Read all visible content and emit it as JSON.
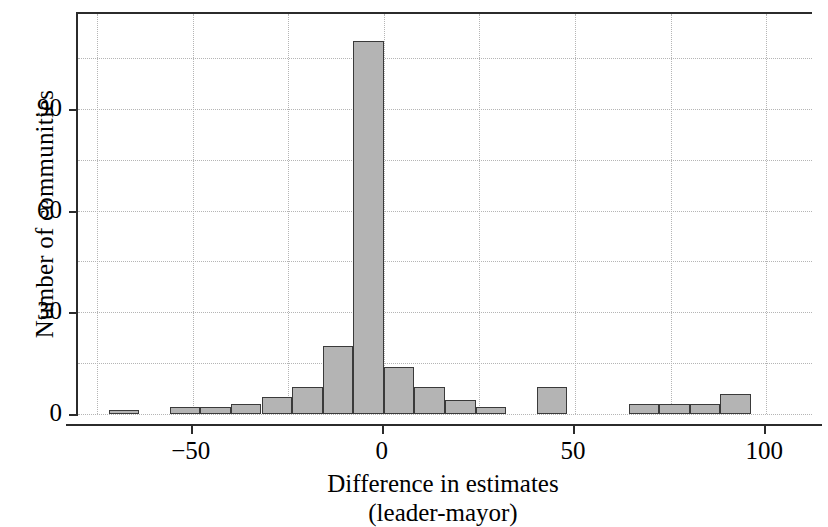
{
  "chart_data": {
    "type": "bar",
    "chart_subtype": "histogram",
    "title": "",
    "xlabel": "Difference in estimates",
    "xlabel_line2": "(leader-mayor)",
    "ylabel": "Number of communities",
    "xlim": [
      -80,
      112
    ],
    "ylim": [
      0,
      118
    ],
    "xticks": [
      -50,
      0,
      50,
      100
    ],
    "xtick_labels": [
      "−50",
      "0",
      "50",
      "100"
    ],
    "yticks": [
      0,
      30,
      60,
      90
    ],
    "ytick_labels": [
      "0",
      "30",
      "60",
      "90"
    ],
    "grid": true,
    "grid_x_minor": [
      -75,
      -50,
      -25,
      0,
      25,
      50,
      75,
      100
    ],
    "grid_y_minor": [
      0,
      15,
      30,
      45,
      60,
      75,
      90,
      105
    ],
    "bin_width": 8,
    "bin_edges": [
      -72,
      -64,
      -56,
      -48,
      -40,
      -32,
      -24,
      -16,
      -8,
      0,
      8,
      16,
      24,
      32,
      40,
      48,
      56,
      64,
      72,
      80,
      88,
      96,
      104
    ],
    "bin_centers": [
      -68,
      -60,
      -52,
      -44,
      -36,
      -28,
      -20,
      -12,
      -4,
      4,
      12,
      20,
      28,
      36,
      44,
      52,
      60,
      68,
      76,
      84,
      92,
      100
    ],
    "values": [
      1,
      0,
      2,
      2,
      3,
      5,
      8,
      20,
      110,
      14,
      8,
      4,
      2,
      0,
      8,
      0,
      0,
      3,
      3,
      3,
      6,
      0
    ],
    "bar_fill_color": "#b4b4b4",
    "bar_edge_color": "#3a3a3a",
    "axis_color": "#2b2b2b",
    "grid_color": "#b5b5b5",
    "background_color": "#ffffff"
  },
  "axes": {
    "y_title": "Number of communities",
    "x_title_line1": "Difference in estimates",
    "x_title_line2": "(leader-mayor)"
  }
}
